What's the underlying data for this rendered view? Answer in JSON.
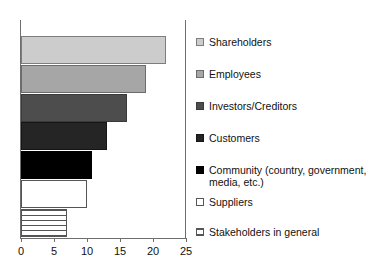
{
  "chart_data": {
    "type": "bar",
    "orientation": "horizontal",
    "title": "",
    "xlabel": "",
    "ylabel": "",
    "xlim": [
      0,
      25
    ],
    "xticks": [
      0,
      5,
      10,
      15,
      20,
      25
    ],
    "xtick_labels": [
      "0",
      "5",
      "10",
      "15",
      "20",
      "25"
    ],
    "grid": false,
    "legend_position": "right",
    "categories": [
      "Shareholders",
      "Employees",
      "Investors/Creditors",
      "Customers",
      "Community (country, government, media, etc.)",
      "Suppliers",
      "Stakeholders in general"
    ],
    "values": [
      22,
      19,
      16,
      13,
      10.7,
      10,
      7
    ],
    "bar_styles": [
      "light-gray-fill",
      "medium-gray-fill",
      "dark-gray-fill",
      "very-dark-gray-fill",
      "black-fill",
      "white-fill",
      "horizontal-stripe-fill"
    ],
    "colors": [
      "#cccccc",
      "#a6a6a6",
      "#4d4d4d",
      "#252525",
      "#000000",
      "#ffffff",
      "#ffffff"
    ]
  },
  "legend": {
    "entries": [
      {
        "label": "Shareholders",
        "swatch": "light-gray-swatch"
      },
      {
        "label": "Employees",
        "swatch": "medium-gray-swatch"
      },
      {
        "label": "Investors/Creditors",
        "swatch": "dark-gray-swatch"
      },
      {
        "label": "Customers",
        "swatch": "very-dark-gray-swatch"
      },
      {
        "label": "Community (country, government,\nmedia, etc.)",
        "swatch": "black-swatch"
      },
      {
        "label": "Suppliers",
        "swatch": "white-swatch"
      },
      {
        "label": "Stakeholders in general",
        "swatch": "horizontal-stripe-swatch"
      }
    ]
  },
  "axis": {
    "tick_labels": [
      "0",
      "5",
      "10",
      "15",
      "20",
      "25"
    ]
  }
}
